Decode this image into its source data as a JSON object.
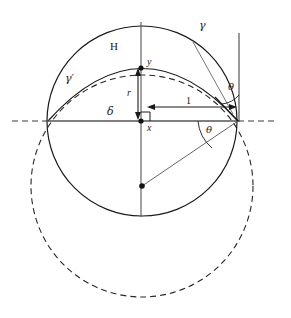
{
  "figure": {
    "type": "geometry-diagram",
    "background_color": "#ffffff",
    "stroke_color": "#1a1a1a"
  },
  "labels": {
    "region_H": "H",
    "curve_gamma": "γ",
    "curve_gamma_prime": "γ′",
    "axis_delta": "δ",
    "radius_r": "r",
    "point_x": "x",
    "point_y": "y",
    "length_one": "1",
    "angle_theta_upper": "θ",
    "angle_theta_lower": "θ"
  },
  "geometry": {
    "solid_circle": {
      "name": "gamma",
      "center_x": 142,
      "center_y": 121,
      "radius": 95,
      "style": "solid"
    },
    "dashed_circle": {
      "name": "lower-circle",
      "center_x": 142,
      "center_y": 186,
      "radius": 111,
      "style": "dashed"
    },
    "arc_gamma_prime": {
      "name": "gamma-prime",
      "left_x": 48,
      "left_y": 121,
      "apex_x": 141,
      "apex_y": 68,
      "right_x": 238,
      "right_y": 121,
      "style": "solid"
    },
    "horizontal_axis": {
      "solid_from_x": 48,
      "solid_to_x": 239,
      "y": 121,
      "dash_left_from_x": 12,
      "dash_right_to_x": 278
    },
    "vertical_axis": {
      "x": 141,
      "from_y": 22,
      "to_y": 217
    },
    "tangent_vertical_line": {
      "x": 239,
      "from_y": 33,
      "to_y": 121
    },
    "points": [
      {
        "name": "origin-x",
        "x": 141,
        "y": 121
      },
      {
        "name": "apex-y",
        "x": 141,
        "y": 68
      },
      {
        "name": "lower-center",
        "x": 142,
        "y": 186
      },
      {
        "name": "tangent-point",
        "x": 238,
        "y": 121
      },
      {
        "name": "left-intersection",
        "x": 48,
        "y": 121
      }
    ],
    "radius_arrow": {
      "x": 138,
      "top_y": 70,
      "bottom_y": 118
    },
    "unit_arrow": {
      "y": 107,
      "left_x": 148,
      "right_x": 236
    },
    "right_angle_marker": {
      "x": 141,
      "y": 121,
      "size": 8
    },
    "angle_arcs": [
      {
        "name": "theta-upper",
        "vertex_x": 238,
        "vertex_y": 121,
        "radius": 26
      },
      {
        "name": "theta-lower",
        "vertex_x": 238,
        "vertex_y": 121,
        "radius": 40
      }
    ],
    "leader_line_gamma": {
      "from_x": 193,
      "from_y": 42,
      "to_x": 232,
      "to_y": 113
    },
    "chord_lower_center_to_tangent": {
      "from_x": 142,
      "from_y": 186,
      "to_x": 238,
      "to_y": 121
    }
  },
  "label_positions": {
    "region_H": {
      "left": 110,
      "top": 41,
      "size": 11
    },
    "curve_gamma": {
      "left": 199,
      "top": 20,
      "size": 11
    },
    "curve_gamma_prime": {
      "left": 65,
      "top": 73,
      "size": 11
    },
    "axis_delta": {
      "left": 107,
      "top": 106,
      "size": 11
    },
    "radius_r": {
      "left": 127,
      "top": 88,
      "size": 10
    },
    "point_x": {
      "left": 147,
      "top": 123,
      "size": 10
    },
    "point_y": {
      "left": 147,
      "top": 57,
      "size": 10
    },
    "length_one": {
      "left": 186,
      "top": 97,
      "size": 10
    },
    "angle_theta_upper": {
      "left": 228,
      "top": 82,
      "size": 10
    },
    "angle_theta_lower": {
      "left": 206,
      "top": 125,
      "size": 10
    }
  }
}
